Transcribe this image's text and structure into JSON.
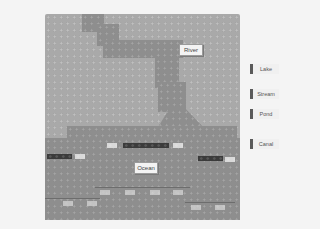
{
  "scene": {
    "description": "Grayscale photo of a LEGO baseplate modeling water features with printed label tiles",
    "colors": {
      "background": "#f4f4f4",
      "baseplate": "#a9a9a9",
      "water_area": "#8e8e8e",
      "dark_brick": "#3b3b3b",
      "light_brick": "#d9d9d9",
      "label_tile": "#f3f3f3"
    }
  },
  "board_labels": {
    "river": "River",
    "ocean": "Ocean"
  },
  "side_labels": [
    {
      "label": "Lake"
    },
    {
      "label": "Stream"
    },
    {
      "label": "Pond"
    },
    {
      "label": "Canal"
    }
  ]
}
